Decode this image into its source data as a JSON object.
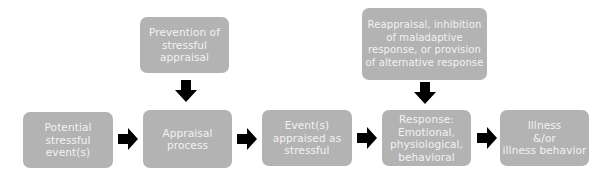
{
  "diagram": {
    "nodes": [
      {
        "id": "potential",
        "label": "Potential\nstressful\nevent(s)"
      },
      {
        "id": "appraisal",
        "label": "Appraisal\nprocess"
      },
      {
        "id": "appraised",
        "label": "Event(s)\nappraised as\nstressful"
      },
      {
        "id": "response",
        "label": "Response:\nEmotional,\nphysiological,\nbehavioral"
      },
      {
        "id": "illness",
        "label": "Illness\n&/or\nillness behavior"
      },
      {
        "id": "prevention",
        "label": "Prevention of\nstressful\nappraisal"
      },
      {
        "id": "reappraisal",
        "label": "Reappraisal, inhibition\nof maladaptive\nresponse, or provision\nof alternative response"
      }
    ],
    "edges": [
      {
        "from": "potential",
        "to": "appraisal"
      },
      {
        "from": "appraisal",
        "to": "appraised"
      },
      {
        "from": "appraised",
        "to": "response"
      },
      {
        "from": "response",
        "to": "illness"
      },
      {
        "from": "prevention",
        "to": "appraisal"
      },
      {
        "from": "reappraisal",
        "to": "response"
      }
    ],
    "colors": {
      "box": "#b3b3b3",
      "text": "#f2f2f2",
      "arrow": "#000000"
    }
  }
}
